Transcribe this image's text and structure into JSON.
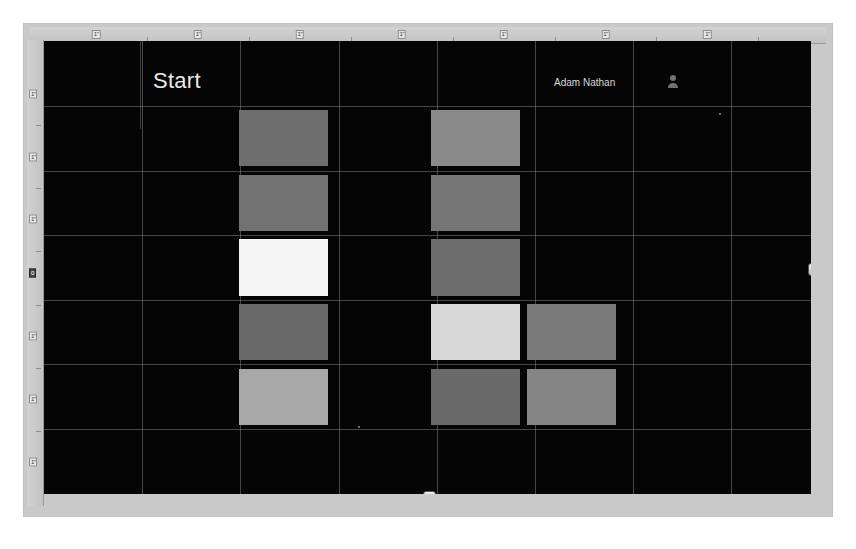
{
  "app": {
    "surface": "powerpoint-slide-editor",
    "workspace_background": "#c9c9c9",
    "slide_background": "#050505"
  },
  "rulers": {
    "horizontal": {
      "name": "horizontal-ruler",
      "unit_label": "1\"",
      "tick_labels": [
        "1\"",
        "1\"",
        "1\"",
        "1\"",
        "1\"",
        "1\"",
        "1\""
      ],
      "tick_positions_pct": [
        8.3,
        21.1,
        33.9,
        46.7,
        59.5,
        72.3,
        85.1
      ],
      "minor_positions_pct": [
        14.7,
        27.5,
        40.3,
        53.1,
        65.9,
        78.7,
        91.5
      ],
      "cursor_label": "1\"",
      "cursor_position_pct": 50.0
    },
    "vertical": {
      "name": "vertical-ruler",
      "unit_label": "1\"",
      "tick_labels": [
        "1\"",
        "1\"",
        "1\"",
        "0",
        "1\"",
        "1\"",
        "1\""
      ],
      "tick_positions_pct": [
        11.5,
        25.0,
        38.5,
        50.0,
        63.5,
        77.0,
        90.5
      ],
      "minor_positions_pct": [
        18.3,
        31.8,
        45.3,
        56.8,
        70.3,
        83.8
      ],
      "cursor_label": "0",
      "cursor_position_pct": 50.0
    }
  },
  "slide": {
    "name": "slide-canvas",
    "title": "Start",
    "user_label": "Adam Nathan",
    "avatar_icon": "user-avatar-icon",
    "grid": {
      "columns": 8,
      "rows": 7,
      "line_color": "#969696",
      "column_positions_pct": [
        12.8,
        25.6,
        38.4,
        51.2,
        64.0,
        76.8,
        89.6
      ],
      "row_positions_pct": [
        14.3,
        28.6,
        42.9,
        57.1,
        71.4,
        85.7
      ]
    },
    "tiles": [
      {
        "name": "tile-col2-row1",
        "column": 2,
        "row": 1,
        "color": "#6e6e6e"
      },
      {
        "name": "tile-col2-row2",
        "column": 2,
        "row": 2,
        "color": "#727272"
      },
      {
        "name": "tile-col2-row3",
        "column": 2,
        "row": 3,
        "color": "#f5f5f5"
      },
      {
        "name": "tile-col2-row4",
        "column": 2,
        "row": 4,
        "color": "#6a6a6a"
      },
      {
        "name": "tile-col2-row5",
        "column": 2,
        "row": 5,
        "color": "#a8a8a8"
      },
      {
        "name": "tile-col4-row1",
        "column": 4,
        "row": 1,
        "color": "#8a8a8a"
      },
      {
        "name": "tile-col4-row2",
        "column": 4,
        "row": 2,
        "color": "#767676"
      },
      {
        "name": "tile-col4-row3",
        "column": 4,
        "row": 3,
        "color": "#6c6c6c"
      },
      {
        "name": "tile-col4-row4",
        "column": 4,
        "row": 4,
        "color": "#d8d8d8"
      },
      {
        "name": "tile-col4-row5",
        "column": 4,
        "row": 5,
        "color": "#6a6a6a"
      },
      {
        "name": "tile-col5-row4",
        "column": 5,
        "row": 4,
        "color": "#7a7a7a"
      },
      {
        "name": "tile-col5-row5",
        "column": 5,
        "row": 5,
        "color": "#858585"
      }
    ]
  },
  "handles": [
    {
      "name": "selection-handle-top",
      "orientation": "horizontal",
      "left_pct": 50.0,
      "top_pct": -1.5
    },
    {
      "name": "selection-handle-bottom",
      "orientation": "horizontal",
      "left_pct": 50.0,
      "top_pct": 100.0
    },
    {
      "name": "selection-handle-right",
      "orientation": "vertical",
      "left_pct": 100.0,
      "top_pct": 50.0
    }
  ]
}
